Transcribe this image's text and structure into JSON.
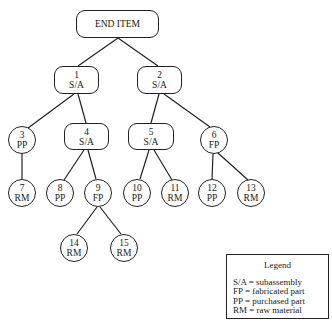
{
  "diagram": {
    "end_item": {
      "label": "END ITEM"
    },
    "nodes": [
      {
        "id": "1",
        "type": "S/A"
      },
      {
        "id": "2",
        "type": "S/A"
      },
      {
        "id": "3",
        "type": "PP"
      },
      {
        "id": "4",
        "type": "S/A"
      },
      {
        "id": "5",
        "type": "S/A"
      },
      {
        "id": "6",
        "type": "FP"
      },
      {
        "id": "7",
        "type": "RM"
      },
      {
        "id": "8",
        "type": "PP"
      },
      {
        "id": "9",
        "type": "FP"
      },
      {
        "id": "10",
        "type": "PP"
      },
      {
        "id": "11",
        "type": "RM"
      },
      {
        "id": "12",
        "type": "PP"
      },
      {
        "id": "13",
        "type": "RM"
      },
      {
        "id": "14",
        "type": "RM"
      },
      {
        "id": "15",
        "type": "RM"
      }
    ],
    "edges": [
      [
        "END ITEM",
        "1"
      ],
      [
        "END ITEM",
        "2"
      ],
      [
        "1",
        "3"
      ],
      [
        "1",
        "4"
      ],
      [
        "2",
        "5"
      ],
      [
        "2",
        "6"
      ],
      [
        "3",
        "7"
      ],
      [
        "4",
        "8"
      ],
      [
        "4",
        "9"
      ],
      [
        "5",
        "10"
      ],
      [
        "5",
        "11"
      ],
      [
        "6",
        "12"
      ],
      [
        "6",
        "13"
      ],
      [
        "9",
        "14"
      ],
      [
        "9",
        "15"
      ]
    ]
  },
  "legend": {
    "title": "Legend",
    "entries": [
      "S/A = subassembly",
      "FP = fabricated part",
      "PP = purchased part",
      "RM = raw material"
    ]
  }
}
